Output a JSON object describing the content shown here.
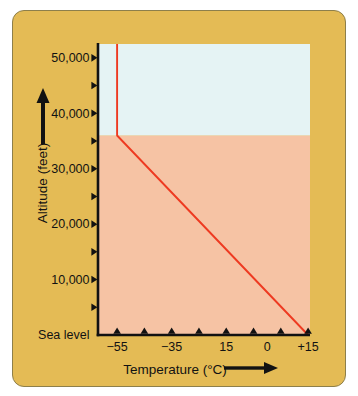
{
  "figure": {
    "background_color": "#ffffff",
    "card_color": "#e4bb55",
    "card_border_color": "#8d7f4b",
    "axis_color": "#121212",
    "text_color": "#121212"
  },
  "chart_data": {
    "type": "line",
    "title": "",
    "xlabel": "Temperature (°C)",
    "ylabel": "Altitude (feet)",
    "xlim": [
      -62,
      15.7
    ],
    "ylim": [
      0,
      52500
    ],
    "grid": false,
    "legend": false,
    "x_ticks": [
      -55,
      -45,
      -35,
      -25,
      -15,
      -5,
      5,
      15
    ],
    "x_labels": [
      {
        "value": -55,
        "text": "−55"
      },
      {
        "value": -35,
        "text": "−35"
      },
      {
        "value": -15,
        "text": "15"
      },
      {
        "value": 0,
        "text": "0"
      },
      {
        "value": 15,
        "text": "+15"
      }
    ],
    "y_ticks": [
      5000,
      10000,
      15000,
      20000,
      25000,
      30000,
      35000,
      40000,
      45000,
      50000
    ],
    "y_labels": [
      {
        "value": 0,
        "text": "Sea level"
      },
      {
        "value": 10000,
        "text": "10,000"
      },
      {
        "value": 20000,
        "text": "20,000"
      },
      {
        "value": 30000,
        "text": "30,000"
      },
      {
        "value": 40000,
        "text": "40,000"
      },
      {
        "value": 50000,
        "text": "50,000"
      }
    ],
    "regions": [
      {
        "name": "lower-atmosphere",
        "alt_from": 0,
        "alt_to": 36000,
        "color": "#f6c3a4"
      },
      {
        "name": "upper-atmosphere",
        "alt_from": 36000,
        "alt_to": 52500,
        "color": "#e5f3f4"
      }
    ],
    "series": [
      {
        "name": "temperature-profile",
        "color": "#ee3a21",
        "points": [
          [
            15,
            0
          ],
          [
            -55,
            36000
          ],
          [
            -55,
            52500
          ]
        ]
      }
    ]
  }
}
